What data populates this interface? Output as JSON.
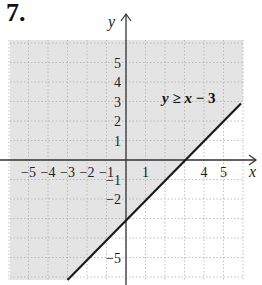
{
  "problem": {
    "number": "7."
  },
  "chart_data": {
    "type": "inequality-graph",
    "title": "",
    "inequality": "y ≥ x − 3",
    "boundary_line": {
      "slope": 1,
      "intercept": -3,
      "style": "solid"
    },
    "shaded_region": "above line",
    "xlabel": "x",
    "ylabel": "y",
    "xlim": [
      -6,
      6
    ],
    "ylim": [
      -6,
      6
    ],
    "grid": true,
    "x_tick_labels": [
      "−5",
      "−4",
      "−3",
      "−2",
      "−1",
      "1",
      "4",
      "5"
    ],
    "x_tick_values": [
      -5,
      -4,
      -3,
      -2,
      -1,
      1,
      4,
      5
    ],
    "y_tick_labels": [
      "5",
      "4",
      "3",
      "2",
      "1",
      "−1",
      "−2",
      "−5"
    ],
    "y_tick_values": [
      5,
      4,
      3,
      2,
      1,
      -1,
      -2,
      -5
    ],
    "colors": {
      "shade": "#e4e4e4",
      "line": "#1a1a1a",
      "grid": "#b0b0b0",
      "axis": "#333333"
    }
  },
  "labels": {
    "x_axis": "x",
    "y_axis": "y",
    "inequality_y": "y",
    "inequality_op": " ≥ ",
    "inequality_x": "x",
    "inequality_rest": " − 3"
  }
}
